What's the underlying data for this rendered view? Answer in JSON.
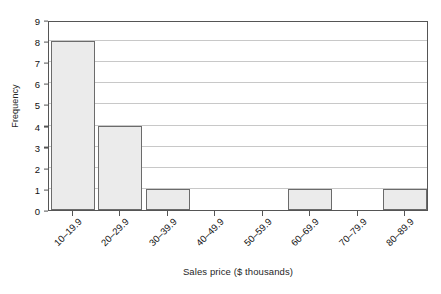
{
  "chart_data": {
    "type": "bar",
    "title": "",
    "xlabel": "Sales price ($ thousands)",
    "ylabel": "Frequency",
    "categories": [
      "10–19.9",
      "20–29.9",
      "30–39.9",
      "40–49.9",
      "50–59.9",
      "60–69.9",
      "70–79.9",
      "80–89.9"
    ],
    "values": [
      8,
      4,
      1,
      0,
      0,
      1,
      0,
      1
    ],
    "ylim": [
      0,
      9
    ],
    "yticks": [
      0,
      1,
      2,
      3,
      4,
      5,
      6,
      7,
      8,
      9
    ],
    "ytick_labels": [
      "0",
      "1",
      "2",
      "3",
      "4",
      "5",
      "6",
      "7",
      "8",
      "9"
    ],
    "grid": "horizontal",
    "legend": "none",
    "bar_fill_color": "#ebebeb",
    "bar_edge_color": "#6b6b6b",
    "gridline_color": "#c8c8c8",
    "axis_color": "#555555",
    "background_color": "#ffffff",
    "text_color": "#111111"
  }
}
